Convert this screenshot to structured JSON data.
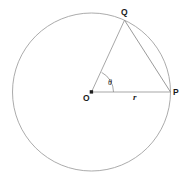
{
  "figure": {
    "name": "circle-radius-angle-diagram",
    "background_color": "#ffffff",
    "stroke_color": "#9a9a9a",
    "chord_color": "#8c8c8c",
    "text_color": "#1a1a1a"
  },
  "circle": {
    "center_x": 91.5,
    "center_y": 92,
    "radius": 79
  },
  "points": {
    "center": {
      "label": "O",
      "x": 91.5,
      "y": 92,
      "label_x": 83,
      "label_y": 101
    },
    "p": {
      "label": "P",
      "x": 170.5,
      "y": 92,
      "label_x": 173,
      "label_y": 95
    },
    "q": {
      "label": "Q",
      "x": 124.5,
      "y": 20.2,
      "label_x": 121,
      "label_y": 15
    }
  },
  "segments": {
    "radius_to_p": {
      "name": "OP",
      "measure_label": "r",
      "label_x": 133,
      "label_y": 100
    },
    "radius_to_q": {
      "name": "OQ"
    },
    "chord_qp": {
      "name": "QP"
    }
  },
  "angle": {
    "symbol": "θ",
    "label_x": 108,
    "label_y": 85,
    "arc_radius": 22,
    "value_degrees": 42
  },
  "caption": {
    "text": ""
  }
}
